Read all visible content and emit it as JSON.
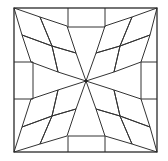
{
  "diagram": {
    "colors": {
      "background": "#ffffff",
      "line": "#333333",
      "hatch_light": "#555555",
      "hatch_dark": "#777777",
      "dark_fill": "#cfcfcf"
    },
    "frame": {
      "x": 14,
      "y": 8,
      "w": 143,
      "h": 144
    },
    "center": {
      "x": 86,
      "y": 81
    },
    "tabs": [
      {
        "name": "top",
        "x": 68,
        "y": 8,
        "w": 37,
        "h": 19
      },
      {
        "name": "left",
        "x": 14,
        "y": 62,
        "w": 19,
        "h": 37
      },
      {
        "name": "right",
        "x": 141,
        "y": 62,
        "w": 16,
        "h": 37
      },
      {
        "name": "bottom",
        "x": 68,
        "y": 136,
        "w": 37,
        "h": 16
      }
    ],
    "kites": [
      {
        "name": "top-left",
        "points": [
          [
            14,
            8
          ],
          [
            67,
            26
          ],
          [
            86,
            81
          ],
          [
            31,
            62
          ]
        ]
      },
      {
        "name": "top-right",
        "points": [
          [
            157,
            8
          ],
          [
            105,
            26
          ],
          [
            86,
            81
          ],
          [
            141,
            62
          ]
        ]
      },
      {
        "name": "bottom-left",
        "points": [
          [
            14,
            152
          ],
          [
            31,
            99
          ],
          [
            86,
            81
          ],
          [
            67,
            136
          ]
        ]
      },
      {
        "name": "bottom-right",
        "points": [
          [
            157,
            152
          ],
          [
            141,
            99
          ],
          [
            86,
            81
          ],
          [
            105,
            136
          ]
        ]
      }
    ]
  }
}
